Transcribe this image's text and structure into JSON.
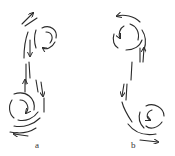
{
  "figure": {
    "panels": [
      {
        "id": "a",
        "label": "a",
        "upper_vortex": "right",
        "lower_vortex": "left"
      },
      {
        "id": "b",
        "label": "b",
        "upper_vortex": "left",
        "lower_vortex": "right"
      }
    ],
    "colors": {
      "ink": "#2a2a2a",
      "background": "#ffffff"
    }
  }
}
